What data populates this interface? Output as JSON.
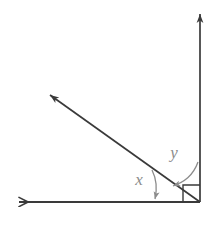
{
  "figure": {
    "type": "geometry-diagram",
    "width": 218,
    "height": 228,
    "background_color": "#ffffff",
    "ray_color": "#3a3a3a",
    "annotation_color": "#8c8c8c",
    "vertex": {
      "x": 200,
      "y": 202
    },
    "rays": [
      {
        "name": "vertical-ray",
        "from": {
          "x": 200,
          "y": 202
        },
        "to": {
          "x": 200,
          "y": 11
        },
        "arrowhead": "closed",
        "direction": "up"
      },
      {
        "name": "horizontal-ray",
        "from": {
          "x": 200,
          "y": 202
        },
        "to": {
          "x": 16,
          "y": 202
        },
        "arrowhead": "open",
        "direction": "left"
      },
      {
        "name": "diagonal-ray",
        "from": {
          "x": 200,
          "y": 202
        },
        "to": {
          "x": 47,
          "y": 93
        },
        "arrowhead": "closed",
        "direction": "up-left"
      }
    ],
    "right_angle_marker": {
      "name": "right-angle-square",
      "corner": {
        "x": 200,
        "y": 202
      },
      "size": 17,
      "value": "90"
    },
    "angle_labels": [
      {
        "id": "y",
        "label": "y",
        "label_x": 174,
        "label_y": 158,
        "between": [
          "vertical-ray",
          "diagonal-ray"
        ],
        "pointer": "curved-arrow"
      },
      {
        "id": "x",
        "label": "x",
        "label_x": 139,
        "label_y": 185,
        "between": [
          "horizontal-ray",
          "diagonal-ray"
        ],
        "pointer": "curved-arrow"
      }
    ]
  }
}
